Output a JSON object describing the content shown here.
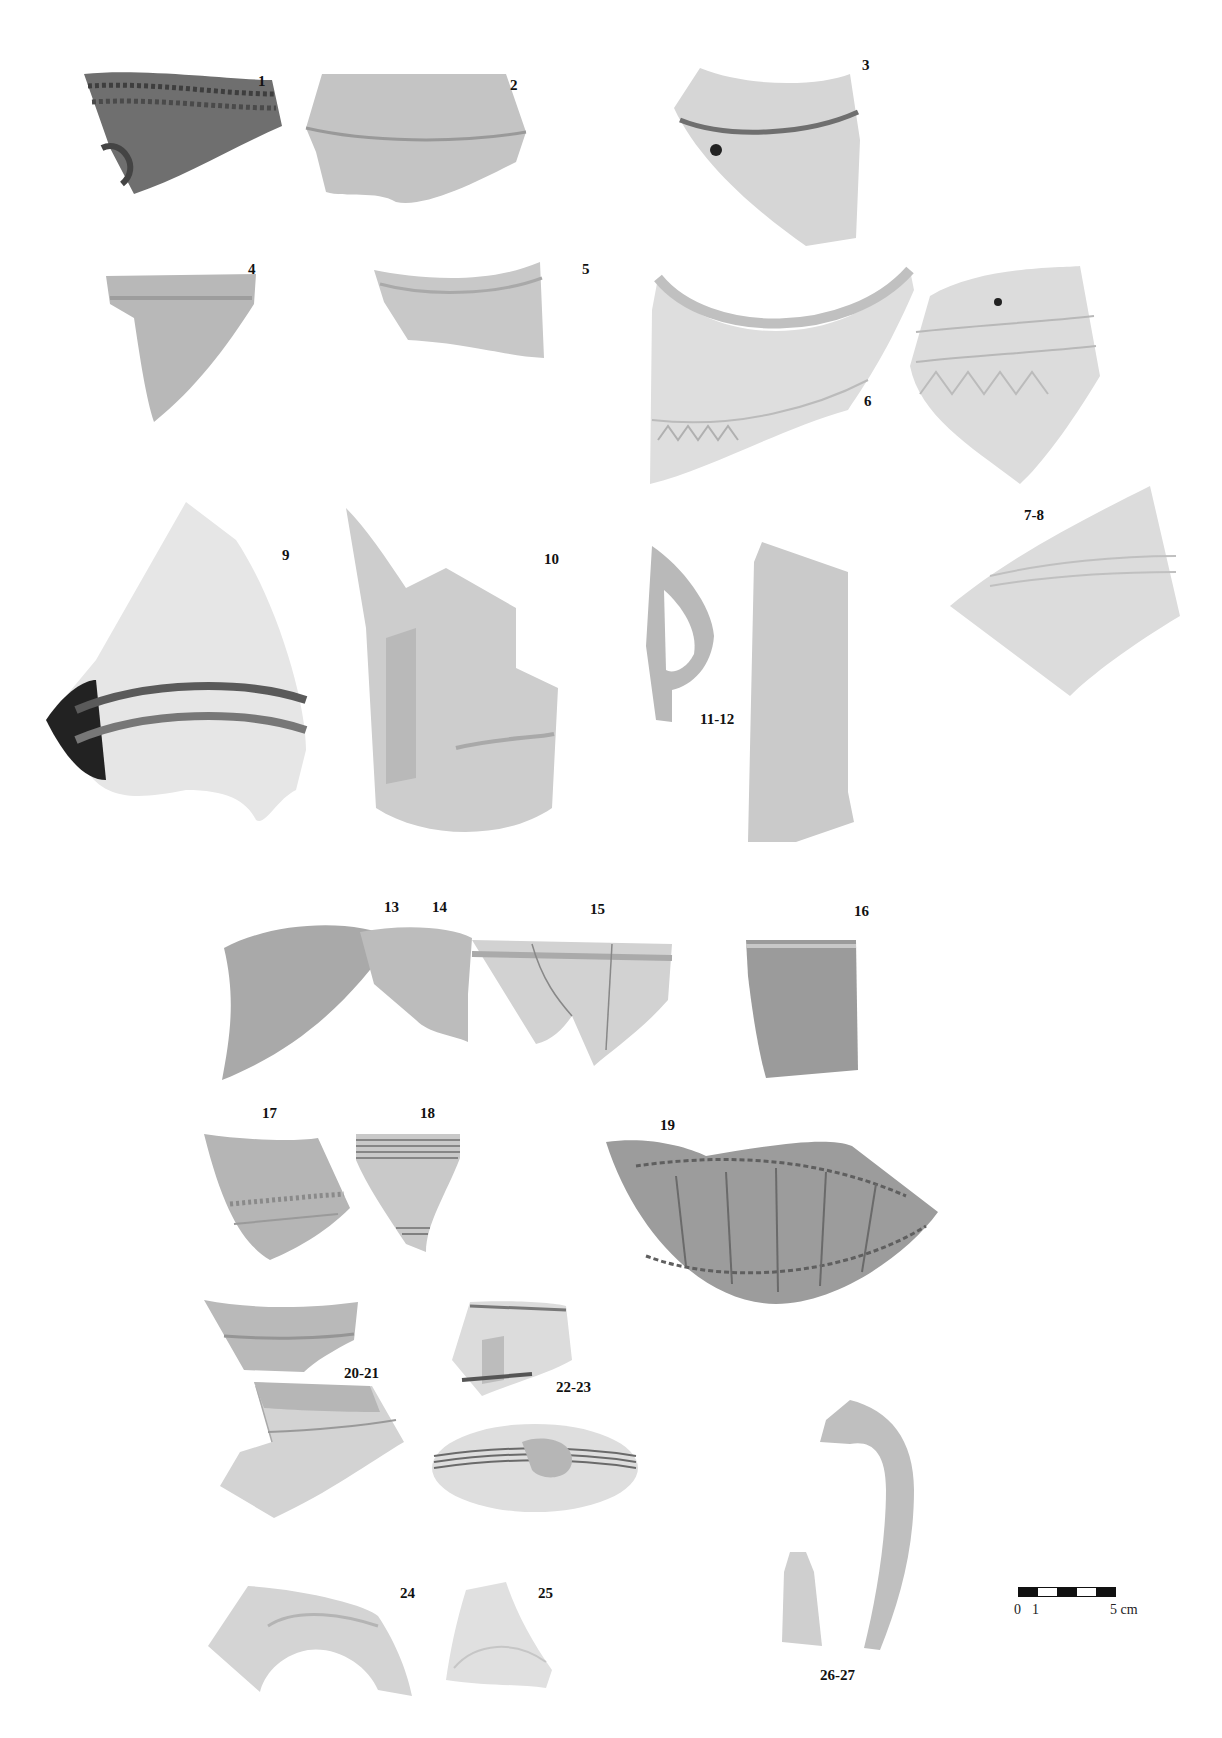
{
  "figure": {
    "background": "#ffffff",
    "sherds": [
      {
        "id": "1",
        "label": "1",
        "tone": "#6f6f6f",
        "decoration": "impressed rope/comb band on rim"
      },
      {
        "id": "2",
        "label": "2",
        "tone": "#c4c4c4",
        "decoration": "plain rim with shoulder ridge"
      },
      {
        "id": "3",
        "label": "3",
        "tone": "#d6d6d6",
        "decoration": "rim with groove and perforation"
      },
      {
        "id": "4",
        "label": "4",
        "tone": "#b8b8b8",
        "decoration": "plain rim"
      },
      {
        "id": "5",
        "label": "5",
        "tone": "#c8c8c8",
        "decoration": "everted rim"
      },
      {
        "id": "6",
        "label": "6",
        "tone": "#dedede",
        "decoration": "rolled rim, incised wavy line"
      },
      {
        "id": "7-8",
        "label": "7-8",
        "tone": "#dcdcdc",
        "decoration": "incised zigzag and dot bands"
      },
      {
        "id": "9",
        "label": "9",
        "tone": "#e2e2e2",
        "decoration": "ribbed shoulder, dark burnish"
      },
      {
        "id": "10",
        "label": "10",
        "tone": "#cdcdcd",
        "decoration": "rim with handle"
      },
      {
        "id": "11-12",
        "label": "11-12",
        "tone": "#c6c6c6",
        "decoration": "loop handle and strap handle"
      },
      {
        "id": "13",
        "label": "13",
        "tone": "#a9a9a9",
        "decoration": "plain rim"
      },
      {
        "id": "14",
        "label": "14",
        "tone": "#bcbcbc",
        "decoration": "plain rim"
      },
      {
        "id": "15",
        "label": "15",
        "tone": "#d2d2d2",
        "decoration": "mended rim fragment"
      },
      {
        "id": "16",
        "label": "16",
        "tone": "#9b9b9b",
        "decoration": "rim with applied lug"
      },
      {
        "id": "17",
        "label": "17",
        "tone": "#b5b5b5",
        "decoration": "incised band"
      },
      {
        "id": "18",
        "label": "18",
        "tone": "#c9c9c9",
        "decoration": "horizontal grooves, painted motifs"
      },
      {
        "id": "19",
        "label": "19",
        "tone": "#8f8f8f",
        "decoration": "dense incised/impressed panels"
      },
      {
        "id": "20-21",
        "label": "20-21",
        "tone": "#b9b9b9",
        "decoration": "rim fragments with band"
      },
      {
        "id": "22-23",
        "label": "22-23",
        "tone": "#d9d9d9",
        "decoration": "grooved body with lug"
      },
      {
        "id": "24",
        "label": "24",
        "tone": "#d4d4d4",
        "decoration": "base ring fragment"
      },
      {
        "id": "25",
        "label": "25",
        "tone": "#e0e0e0",
        "decoration": "base fragment with inked number"
      },
      {
        "id": "26-27",
        "label": "26-27",
        "tone": "#c2c2c2",
        "decoration": "curved handle and fragment"
      }
    ],
    "scale_bar": {
      "label_start": "0",
      "label_one": "1",
      "label_end": "5 cm",
      "segments": [
        "dark",
        "light",
        "dark",
        "light",
        "dark"
      ]
    }
  }
}
